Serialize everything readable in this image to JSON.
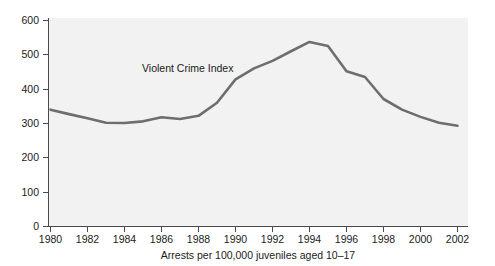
{
  "chart_data": {
    "type": "line",
    "title": "",
    "subtitle": "",
    "xlabel": "Arrests per 100,000 juveniles aged 10–17",
    "ylabel": "",
    "xlim": [
      1980,
      2002
    ],
    "ylim": [
      0,
      600
    ],
    "grid": false,
    "legend_position": "inline-annotation",
    "annotations": [
      {
        "text": "Violent Crime Index",
        "x": 1986.0,
        "y": 430
      }
    ],
    "x_tick_labels": [
      "1980",
      "1982",
      "1984",
      "1986",
      "1988",
      "1990",
      "1992",
      "1994",
      "1996",
      "1998",
      "2000",
      "2002"
    ],
    "x_ticks": [
      1980,
      1982,
      1984,
      1986,
      1988,
      1990,
      1992,
      1994,
      1996,
      1998,
      2000,
      2002
    ],
    "y_tick_labels": [
      "0",
      "100",
      "200",
      "300",
      "400",
      "500",
      "600"
    ],
    "y_ticks": [
      0,
      100,
      200,
      300,
      400,
      500,
      600
    ],
    "series": [
      {
        "name": "Violent Crime Index",
        "color": "#6e6e6e",
        "x": [
          1980,
          1981,
          1982,
          1983,
          1984,
          1985,
          1986,
          1987,
          1988,
          1989,
          1990,
          1991,
          1992,
          1993,
          1994,
          1995,
          1996,
          1997,
          1998,
          1999,
          2000,
          2001,
          2002
        ],
        "values": [
          340,
          327,
          315,
          302,
          301,
          306,
          318,
          313,
          322,
          360,
          428,
          460,
          482,
          510,
          537,
          525,
          452,
          435,
          371,
          340,
          319,
          302,
          293
        ]
      }
    ]
  },
  "axis": {
    "line_color": "#4a4a4a",
    "plot_background": "#f2f2f2"
  }
}
